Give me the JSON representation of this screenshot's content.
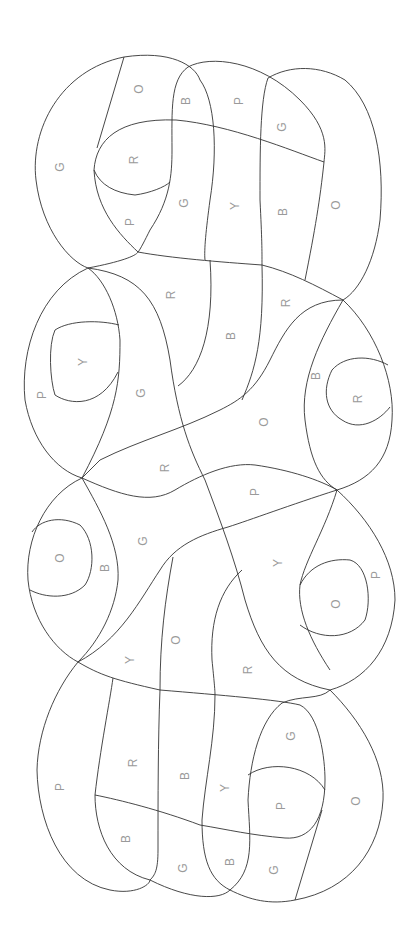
{
  "puzzle": {
    "type": "color-by-letter",
    "legend_letters": [
      "R",
      "O",
      "Y",
      "G",
      "B",
      "P"
    ],
    "line_color": "#333333",
    "label_color": "#9a9a9a",
    "labels": [
      {
        "t": "G",
        "x": 60,
        "y": 167
      },
      {
        "t": "O",
        "x": 139,
        "y": 89
      },
      {
        "t": "B",
        "x": 186,
        "y": 101
      },
      {
        "t": "P",
        "x": 239,
        "y": 101
      },
      {
        "t": "G",
        "x": 282,
        "y": 127
      },
      {
        "t": "R",
        "x": 134,
        "y": 160
      },
      {
        "t": "P",
        "x": 130,
        "y": 222
      },
      {
        "t": "G",
        "x": 184,
        "y": 203
      },
      {
        "t": "Y",
        "x": 235,
        "y": 206
      },
      {
        "t": "B",
        "x": 283,
        "y": 212
      },
      {
        "t": "O",
        "x": 336,
        "y": 205
      },
      {
        "t": "R",
        "x": 171,
        "y": 295
      },
      {
        "t": "B",
        "x": 231,
        "y": 336
      },
      {
        "t": "R",
        "x": 286,
        "y": 303
      },
      {
        "t": "Y",
        "x": 83,
        "y": 362
      },
      {
        "t": "P",
        "x": 42,
        "y": 395
      },
      {
        "t": "G",
        "x": 141,
        "y": 393
      },
      {
        "t": "B",
        "x": 316,
        "y": 376
      },
      {
        "t": "R",
        "x": 358,
        "y": 399
      },
      {
        "t": "O",
        "x": 264,
        "y": 422
      },
      {
        "t": "R",
        "x": 165,
        "y": 468
      },
      {
        "t": "P",
        "x": 255,
        "y": 492
      },
      {
        "t": "G",
        "x": 143,
        "y": 541
      },
      {
        "t": "O",
        "x": 60,
        "y": 558
      },
      {
        "t": "B",
        "x": 105,
        "y": 568
      },
      {
        "t": "Y",
        "x": 278,
        "y": 563
      },
      {
        "t": "P",
        "x": 376,
        "y": 575
      },
      {
        "t": "O",
        "x": 336,
        "y": 604
      },
      {
        "t": "O",
        "x": 176,
        "y": 640
      },
      {
        "t": "Y",
        "x": 130,
        "y": 660
      },
      {
        "t": "R",
        "x": 248,
        "y": 670
      },
      {
        "t": "R",
        "x": 133,
        "y": 763
      },
      {
        "t": "P",
        "x": 60,
        "y": 787
      },
      {
        "t": "B",
        "x": 185,
        "y": 776
      },
      {
        "t": "Y",
        "x": 225,
        "y": 788
      },
      {
        "t": "G",
        "x": 291,
        "y": 736
      },
      {
        "t": "P",
        "x": 281,
        "y": 806
      },
      {
        "t": "O",
        "x": 356,
        "y": 801
      },
      {
        "t": "B",
        "x": 126,
        "y": 839
      },
      {
        "t": "G",
        "x": 183,
        "y": 868
      },
      {
        "t": "B",
        "x": 230,
        "y": 862
      },
      {
        "t": "G",
        "x": 274,
        "y": 870
      }
    ]
  }
}
